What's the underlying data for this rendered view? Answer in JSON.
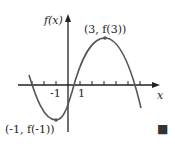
{
  "diagram": {
    "y_axis_label": "f(x)",
    "x_axis_label": "x",
    "tick_labels": {
      "neg_one": "-1",
      "one": "1"
    },
    "max_point_label": "(3, f(3))",
    "min_point_label": "(-1, f(-1))",
    "end_marker": "■",
    "colors": {
      "curve": "#555555",
      "axis": "#222222",
      "marker": "#333333"
    }
  }
}
